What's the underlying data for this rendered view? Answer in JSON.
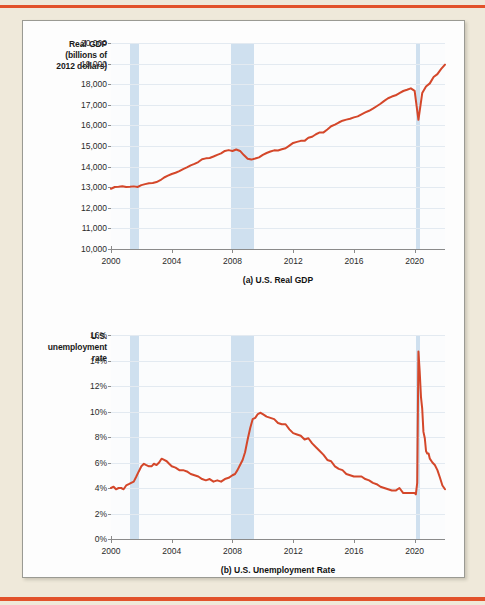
{
  "figure": {
    "background_color": "#efe9da",
    "panel_color": "#fdfdfd",
    "rule_color": "#e2522b"
  },
  "chart_data": [
    {
      "id": "gdp",
      "type": "line",
      "title": "",
      "caption": "(a) U.S. Real GDP",
      "ylabel": "Real GDP\n(billions of\n2012 dollars)",
      "ylabel_lines": [
        "Real GDP",
        "(billions of",
        "2012 dollars)"
      ],
      "xlabel": "",
      "series_color": "#d4472a",
      "recession_color": "#cfe0ef",
      "grid": true,
      "legend": "none",
      "xlim": [
        2000,
        2022.0
      ],
      "ylim": [
        10000,
        20000
      ],
      "yticks": [
        10000,
        11000,
        12000,
        13000,
        14000,
        15000,
        16000,
        17000,
        18000,
        19000,
        20000
      ],
      "ytick_labels": [
        "10,000",
        "11,000",
        "12,000",
        "13,000",
        "14,000",
        "15,000",
        "16,000",
        "17,000",
        "18,000",
        "19,000",
        "20,000"
      ],
      "xticks": [
        2000,
        2004,
        2008,
        2012,
        2016,
        2020
      ],
      "xtick_labels": [
        "2000",
        "2004",
        "2008",
        "2012",
        "2016",
        "2020"
      ],
      "recessions": [
        {
          "start": 2001.25,
          "end": 2001.83,
          "label": "2001 recession"
        },
        {
          "start": 2007.92,
          "end": 2009.42,
          "label": "2008-2009 recession"
        },
        {
          "start": 2020.08,
          "end": 2020.33,
          "label": "2020 recession"
        }
      ],
      "x": [
        2000.0,
        2000.25,
        2000.5,
        2000.75,
        2001.0,
        2001.25,
        2001.5,
        2001.75,
        2002.0,
        2002.25,
        2002.5,
        2002.75,
        2003.0,
        2003.25,
        2003.5,
        2003.75,
        2004.0,
        2004.25,
        2004.5,
        2004.75,
        2005.0,
        2005.25,
        2005.5,
        2005.75,
        2006.0,
        2006.25,
        2006.5,
        2006.75,
        2007.0,
        2007.25,
        2007.5,
        2007.75,
        2008.0,
        2008.25,
        2008.5,
        2008.75,
        2009.0,
        2009.25,
        2009.5,
        2009.75,
        2010.0,
        2010.25,
        2010.5,
        2010.75,
        2011.0,
        2011.25,
        2011.5,
        2011.75,
        2012.0,
        2012.25,
        2012.5,
        2012.75,
        2013.0,
        2013.25,
        2013.5,
        2013.75,
        2014.0,
        2014.25,
        2014.5,
        2014.75,
        2015.0,
        2015.25,
        2015.5,
        2015.75,
        2016.0,
        2016.25,
        2016.5,
        2016.75,
        2017.0,
        2017.25,
        2017.5,
        2017.75,
        2018.0,
        2018.25,
        2018.5,
        2018.75,
        2019.0,
        2019.25,
        2019.5,
        2019.75,
        2020.0,
        2020.25,
        2020.5,
        2020.75,
        2021.0,
        2021.25,
        2021.5,
        2021.75,
        2022.0
      ],
      "values": [
        12925,
        13010,
        13025,
        13050,
        13010,
        13020,
        13040,
        13010,
        13100,
        13150,
        13190,
        13200,
        13250,
        13340,
        13470,
        13560,
        13640,
        13700,
        13780,
        13880,
        13960,
        14060,
        14130,
        14220,
        14360,
        14400,
        14420,
        14490,
        14570,
        14640,
        14760,
        14800,
        14760,
        14830,
        14760,
        14560,
        14380,
        14340,
        14390,
        14450,
        14570,
        14660,
        14730,
        14790,
        14780,
        14840,
        14890,
        15020,
        15150,
        15200,
        15250,
        15250,
        15400,
        15450,
        15570,
        15660,
        15660,
        15800,
        15960,
        16040,
        16140,
        16230,
        16280,
        16320,
        16390,
        16440,
        16540,
        16630,
        16710,
        16810,
        16930,
        17050,
        17190,
        17320,
        17400,
        17460,
        17570,
        17670,
        17730,
        17800,
        17680,
        16270,
        17570,
        17890,
        18040,
        18350,
        18490,
        18740,
        18950
      ],
      "annotations": [
        {
          "text": "GDP falls during 2001 recession",
          "at": 2001.5
        },
        {
          "text": "GDP falls sharply in 2008-2009 recession",
          "at": 2009.0
        },
        {
          "text": "Sharp V-shaped COVID-19 collapse and recovery in 2020",
          "at": 2020.25
        }
      ]
    },
    {
      "id": "unemployment",
      "type": "line",
      "title": "",
      "caption": "(b) U.S. Unemployment Rate",
      "ylabel": "U.S.\nunemployment\nrate",
      "ylabel_lines": [
        "U.S.",
        "unemployment",
        "rate"
      ],
      "xlabel": "",
      "series_color": "#d4472a",
      "recession_color": "#cfe0ef",
      "grid": true,
      "legend": "none",
      "xlim": [
        2000,
        2022.0
      ],
      "ylim": [
        0,
        16
      ],
      "yticks": [
        0,
        2,
        4,
        6,
        8,
        10,
        12,
        14,
        16
      ],
      "ytick_labels": [
        "0%",
        "2%",
        "4%",
        "6%",
        "8%",
        "10%",
        "12%",
        "14%",
        "16%"
      ],
      "xticks": [
        2000,
        2004,
        2008,
        2012,
        2016,
        2020
      ],
      "xtick_labels": [
        "2000",
        "2004",
        "2008",
        "2012",
        "2016",
        "2020"
      ],
      "recessions": [
        {
          "start": 2001.25,
          "end": 2001.83,
          "label": "2001 recession"
        },
        {
          "start": 2007.92,
          "end": 2009.42,
          "label": "2008-2009 recession"
        },
        {
          "start": 2020.08,
          "end": 2020.33,
          "label": "2020 recession"
        }
      ],
      "x": [
        2000.0,
        2000.17,
        2000.33,
        2000.5,
        2000.67,
        2000.83,
        2001.0,
        2001.17,
        2001.33,
        2001.5,
        2001.67,
        2001.83,
        2002.0,
        2002.17,
        2002.33,
        2002.5,
        2002.67,
        2002.83,
        2003.0,
        2003.17,
        2003.33,
        2003.5,
        2003.67,
        2003.83,
        2004.0,
        2004.25,
        2004.5,
        2004.75,
        2005.0,
        2005.25,
        2005.5,
        2005.75,
        2006.0,
        2006.25,
        2006.5,
        2006.75,
        2007.0,
        2007.25,
        2007.5,
        2007.75,
        2008.0,
        2008.17,
        2008.33,
        2008.5,
        2008.67,
        2008.83,
        2009.0,
        2009.17,
        2009.33,
        2009.5,
        2009.67,
        2009.83,
        2010.0,
        2010.25,
        2010.5,
        2010.75,
        2011.0,
        2011.25,
        2011.5,
        2011.75,
        2012.0,
        2012.25,
        2012.5,
        2012.75,
        2013.0,
        2013.25,
        2013.5,
        2013.75,
        2014.0,
        2014.25,
        2014.5,
        2014.75,
        2015.0,
        2015.25,
        2015.5,
        2015.75,
        2016.0,
        2016.25,
        2016.5,
        2016.75,
        2017.0,
        2017.25,
        2017.5,
        2017.75,
        2018.0,
        2018.25,
        2018.5,
        2018.75,
        2019.0,
        2019.25,
        2019.5,
        2019.75,
        2020.0,
        2020.08,
        2020.17,
        2020.25,
        2020.33,
        2020.42,
        2020.5,
        2020.58,
        2020.67,
        2020.75,
        2020.83,
        2020.92,
        2021.0,
        2021.17,
        2021.33,
        2021.5,
        2021.67,
        2021.83,
        2022.0
      ],
      "values": [
        4.0,
        4.1,
        3.9,
        4.0,
        4.0,
        3.9,
        4.2,
        4.3,
        4.4,
        4.5,
        4.9,
        5.3,
        5.7,
        5.9,
        5.8,
        5.7,
        5.7,
        5.9,
        5.8,
        6.0,
        6.3,
        6.2,
        6.1,
        5.9,
        5.7,
        5.6,
        5.4,
        5.4,
        5.3,
        5.1,
        5.0,
        4.9,
        4.7,
        4.6,
        4.7,
        4.5,
        4.6,
        4.5,
        4.7,
        4.8,
        5.0,
        5.1,
        5.4,
        5.8,
        6.2,
        6.8,
        7.8,
        8.7,
        9.4,
        9.5,
        9.8,
        9.9,
        9.8,
        9.6,
        9.5,
        9.4,
        9.1,
        9.0,
        9.0,
        8.6,
        8.3,
        8.2,
        8.1,
        7.8,
        7.9,
        7.5,
        7.2,
        6.9,
        6.6,
        6.2,
        6.1,
        5.7,
        5.5,
        5.4,
        5.1,
        5.0,
        4.9,
        4.9,
        4.9,
        4.7,
        4.6,
        4.4,
        4.3,
        4.1,
        4.0,
        3.9,
        3.8,
        3.8,
        4.0,
        3.6,
        3.6,
        3.6,
        3.6,
        3.5,
        4.4,
        14.7,
        13.2,
        11.1,
        10.2,
        8.4,
        7.9,
        6.9,
        6.7,
        6.7,
        6.3,
        6.0,
        5.8,
        5.4,
        4.8,
        4.2,
        3.9
      ],
      "annotations": [
        {
          "text": "Unemployment rises after 2001 recession, peaking near 6.3%",
          "at": 2003.33
        },
        {
          "text": "Unemployment peaks near 10% in 2009-2010",
          "at": 2009.83
        },
        {
          "text": "Unemployment spikes to 14.7% in April 2020",
          "at": 2020.25
        }
      ]
    }
  ]
}
